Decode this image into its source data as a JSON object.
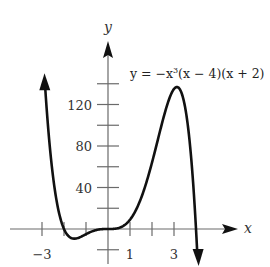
{
  "chart_data": {
    "type": "line",
    "title": "",
    "xlabel": "x",
    "ylabel": "y",
    "function": "y = -x^3 (x - 4)(x + 2)",
    "annotation": {
      "text_parts": [
        "y = −x",
        "3",
        "(x − 4)(x + 2)"
      ]
    },
    "xlim": [
      -3,
      4.05
    ],
    "ylim": [
      -20,
      140
    ],
    "x_ticks": [
      -3,
      -2,
      -1,
      1,
      2,
      3
    ],
    "x_tick_labels": [
      {
        "value": -3,
        "label": "−3"
      },
      {
        "value": 1,
        "label": "1"
      },
      {
        "value": 3,
        "label": "3"
      }
    ],
    "y_ticks": [
      -20,
      20,
      40,
      60,
      80,
      100,
      120,
      140
    ],
    "y_tick_labels": [
      {
        "value": 40,
        "label": "40"
      },
      {
        "value": 80,
        "label": "80"
      },
      {
        "value": 120,
        "label": "120"
      }
    ],
    "series": [
      {
        "name": "y = −x³(x−4)(x+2)",
        "x": [
          -2.85,
          -2.5,
          -2.0,
          -1.5,
          -1.3,
          -1.0,
          -0.5,
          0.0,
          0.5,
          1.0,
          1.5,
          2.0,
          2.5,
          3.0,
          3.2,
          3.5,
          3.8,
          4.0
        ],
        "y": [
          148.6,
          70.3,
          0.0,
          -7.6,
          -8.2,
          -5.0,
          -1.0,
          0.0,
          1.1,
          9.0,
          30.4,
          64.0,
          101.6,
          135.0,
          137.6,
          117.9,
          62.6,
          0.0
        ],
        "left_end": "arrow-up",
        "right_end": "arrow-down"
      }
    ],
    "grid": false,
    "legend": "none"
  }
}
